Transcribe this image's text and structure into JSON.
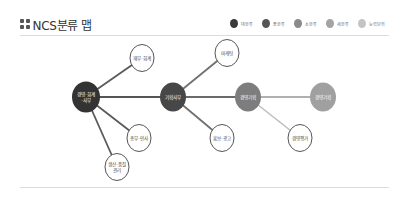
{
  "header": {
    "title": "NCS분류 맵",
    "icon": "grid-icon"
  },
  "legend": [
    {
      "label": "대분류",
      "color": "#3a3a3a"
    },
    {
      "label": "중분류",
      "color": "#555555"
    },
    {
      "label": "소분류",
      "color": "#8a8a8a"
    },
    {
      "label": "세분류",
      "color": "#a3a3a3"
    },
    {
      "label": "능력단위",
      "color": "#c4c4c4"
    }
  ],
  "map": {
    "nodes": [
      {
        "id": "n1",
        "label": "경영·회계",
        "label2": "·사무",
        "level": "대분류",
        "x": 86,
        "y": 97,
        "r": 14,
        "fill": "#333333",
        "text": "#ffffff"
      },
      {
        "id": "n2",
        "label": "재무·회계",
        "label2": "",
        "level": "중분류",
        "x": 142,
        "y": 58,
        "r": 12,
        "fill": "#ffffff",
        "text": "#444444"
      },
      {
        "id": "n3",
        "label": "총무·인사",
        "label2": "",
        "level": "중분류",
        "x": 139,
        "y": 138,
        "r": 12,
        "fill": "#ffffff",
        "text": "#444444"
      },
      {
        "id": "n4",
        "label": "생산·품질",
        "label2": "관리",
        "level": "중분류",
        "x": 117,
        "y": 167,
        "r": 12,
        "fill": "#ffffff",
        "text": "#444444"
      },
      {
        "id": "n5",
        "label": "기획사무",
        "label2": "",
        "level": "중분류",
        "x": 173,
        "y": 97,
        "r": 13,
        "fill": "#474747",
        "text": "#ffffff"
      },
      {
        "id": "n6",
        "label": "마케팅",
        "label2": "",
        "level": "소분류",
        "x": 227,
        "y": 53,
        "r": 12,
        "fill": "#ffffff",
        "text": "#444444"
      },
      {
        "id": "n7",
        "label": "홍보·광고",
        "label2": "",
        "level": "소분류",
        "x": 222,
        "y": 138,
        "r": 12,
        "fill": "#ffffff",
        "text": "#444444"
      },
      {
        "id": "n8",
        "label": "경영기획",
        "label2": "",
        "level": "소분류",
        "x": 248,
        "y": 97,
        "r": 13,
        "fill": "#7d7d7d",
        "text": "#ffffff"
      },
      {
        "id": "n9",
        "label": "경영평가",
        "label2": "",
        "level": "세분류",
        "x": 300,
        "y": 138,
        "r": 12,
        "fill": "#ffffff",
        "text": "#444444"
      },
      {
        "id": "n10",
        "label": "경영기획",
        "label2": "",
        "level": "세분류",
        "x": 323,
        "y": 97,
        "r": 13,
        "fill": "#a0a0a0",
        "text": "#ffffff"
      }
    ],
    "edges": [
      {
        "from": "n1",
        "to": "n2",
        "color": "#5a5a5a",
        "width": 1.8
      },
      {
        "from": "n1",
        "to": "n3",
        "color": "#5a5a5a",
        "width": 1.8
      },
      {
        "from": "n1",
        "to": "n4",
        "color": "#5a5a5a",
        "width": 1.8
      },
      {
        "from": "n1",
        "to": "n5",
        "color": "#555555",
        "width": 2.2
      },
      {
        "from": "n5",
        "to": "n6",
        "color": "#707070",
        "width": 1.8
      },
      {
        "from": "n5",
        "to": "n7",
        "color": "#707070",
        "width": 1.8
      },
      {
        "from": "n5",
        "to": "n8",
        "color": "#6a6a6a",
        "width": 2.2
      },
      {
        "from": "n8",
        "to": "n9",
        "color": "#bcbcbc",
        "width": 1.5
      },
      {
        "from": "n8",
        "to": "n10",
        "color": "#b0b0b0",
        "width": 2.0
      }
    ]
  }
}
